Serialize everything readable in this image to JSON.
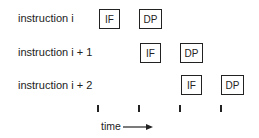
{
  "rows": [
    {
      "label": "instruction i",
      "stages": [
        "IF",
        "DP"
      ]
    },
    {
      "label": "instruction i + 1",
      "stages": [
        "IF",
        "DP"
      ]
    },
    {
      "label": "instruction i + 2",
      "stages": [
        "IF",
        "DP"
      ]
    }
  ],
  "axis": {
    "label": "time"
  }
}
